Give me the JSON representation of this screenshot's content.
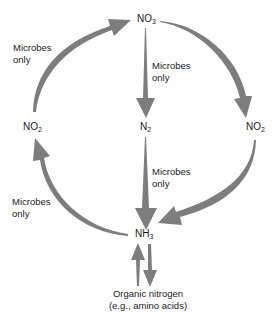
{
  "diagram": {
    "arrow_color": "#7d7d7d",
    "nodes": {
      "no3": {
        "base": "NO",
        "sub": "3"
      },
      "n2": {
        "base": "N",
        "sub": "2"
      },
      "no2_left": {
        "base": "NO",
        "sub": "2"
      },
      "no2_right": {
        "base": "NO",
        "sub": "2"
      },
      "nh3": {
        "base": "NH",
        "sub": "3"
      }
    },
    "organic": {
      "line1": "Organic nitrogen",
      "line2": "(e.g., amino acids)"
    },
    "labels": {
      "top_left": {
        "line1": "Microbes",
        "line2": "only"
      },
      "center_top": {
        "line1": "Microbes",
        "line2": "only"
      },
      "center_bottom": {
        "line1": "Microbes",
        "line2": "only"
      },
      "bottom_left": {
        "line1": "Microbes",
        "line2": "only"
      }
    },
    "edges": [
      {
        "from": "NO2 (left)",
        "to": "NO3",
        "label": "Microbes only"
      },
      {
        "from": "NO3",
        "to": "N2",
        "label": "Microbes only"
      },
      {
        "from": "NO3",
        "to": "NO2 (right)",
        "label": ""
      },
      {
        "from": "N2",
        "to": "NH3",
        "label": "Microbes only"
      },
      {
        "from": "NO2 (right)",
        "to": "NH3",
        "label": ""
      },
      {
        "from": "NH3",
        "to": "NO2 (left)",
        "label": "Microbes only"
      },
      {
        "from": "Organic nitrogen",
        "to": "NH3",
        "label": ""
      },
      {
        "from": "NH3",
        "to": "Organic nitrogen",
        "label": ""
      }
    ]
  }
}
